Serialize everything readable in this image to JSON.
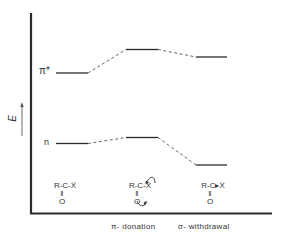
{
  "diagram": {
    "axis": {
      "y_label": "E",
      "y_arrow": "increasing-energy"
    },
    "levels": {
      "pi_star": {
        "label": "π*"
      },
      "n": {
        "label": "n"
      }
    },
    "columns": [
      {
        "id": "reference",
        "structure": {
          "top": "R-C-Ẍ",
          "bond": "‖",
          "bottom": "O"
        },
        "caption": ""
      },
      {
        "id": "pi-donation",
        "structure": {
          "top": "R-C-Ẍ",
          "bond": "‖",
          "bottom": "O"
        },
        "caption": "π- donation"
      },
      {
        "id": "sigma-withdrawal",
        "structure": {
          "top": "R-C▸Ẍ",
          "bond": "‖",
          "bottom": "O"
        },
        "caption": "σ- withdrawal"
      }
    ],
    "energy_levels": {
      "pi_star": [
        "baseline",
        "raised",
        "slightly raised"
      ],
      "n": [
        "baseline",
        "slightly raised",
        "lowered"
      ]
    },
    "colors": {
      "line": "#2a2a2a",
      "dash": "#555555",
      "text": "#333333",
      "background": "#ffffff"
    }
  }
}
